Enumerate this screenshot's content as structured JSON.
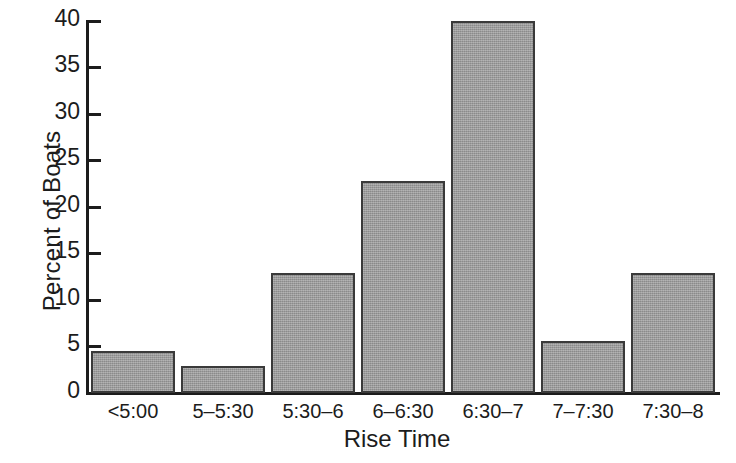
{
  "chart_data": {
    "type": "bar",
    "title": "",
    "subtitle": "",
    "xlabel": "Rise Time",
    "ylabel": "Percent of Boats",
    "categories": [
      "<5:00",
      "5–5:30",
      "5:30–6",
      "6–6:30",
      "6:30–7",
      "7–7:30",
      "7:30–8"
    ],
    "values": [
      4.5,
      2.9,
      12.9,
      22.8,
      40.0,
      5.6,
      12.9
    ],
    "ylim": [
      0,
      40
    ],
    "xlim": [
      0,
      7
    ],
    "yticks": [
      0,
      5,
      10,
      15,
      20,
      25,
      30,
      35,
      40
    ],
    "ytick_labels": [
      "0",
      "5",
      "10",
      "15",
      "20",
      "25",
      "30",
      "35",
      "40"
    ],
    "grid": false,
    "legend": null,
    "legend_position": "none",
    "bar_fill_color": "#9b9b9b",
    "bar_edge_color": "#3a3a3a",
    "axis_color": "#1c1c1c",
    "background_color": "#ffffff"
  }
}
